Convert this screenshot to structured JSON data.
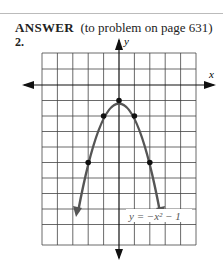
{
  "header": {
    "label": "ANSWER",
    "reference": "(to problem on page 631)"
  },
  "problem_number": "2.",
  "graph": {
    "x_axis_label": "x",
    "y_axis_label": "y",
    "equation": "y = −x² − 1",
    "points": [
      [
        -2,
        -5
      ],
      [
        -1,
        -2
      ],
      [
        0,
        -1
      ],
      [
        1,
        -2
      ],
      [
        2,
        -5
      ]
    ],
    "curve_color": "#555555"
  }
}
